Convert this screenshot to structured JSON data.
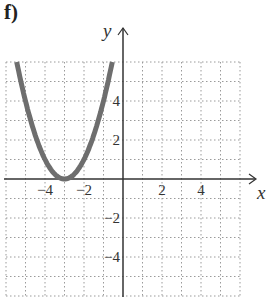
{
  "figure_label": "f)",
  "chart_data": {
    "type": "line",
    "title": "",
    "function": "y = (x + 3)^2",
    "xlabel": "x",
    "ylabel": "y",
    "xlim": [
      -6,
      6
    ],
    "ylim": [
      -6,
      6
    ],
    "grid": true,
    "x_ticks": [
      -4,
      -2,
      2,
      4
    ],
    "y_ticks": [
      4,
      2,
      -2,
      -4
    ],
    "x_tick_labels": [
      "−4",
      "−2",
      "2",
      "4"
    ],
    "y_tick_labels": [
      "4",
      "2",
      "−2",
      "−4"
    ],
    "vertex": [
      -3,
      0
    ],
    "series": [
      {
        "name": "parabola",
        "color": "#6e6e6e",
        "x": [
          -5.45,
          -5,
          -4.5,
          -4,
          -3.5,
          -3,
          -2.5,
          -2,
          -1.5,
          -1,
          -0.55
        ],
        "y": [
          6.0,
          4.0,
          2.25,
          1.0,
          0.25,
          0,
          0.25,
          1.0,
          2.25,
          4.0,
          6.0
        ]
      }
    ]
  }
}
